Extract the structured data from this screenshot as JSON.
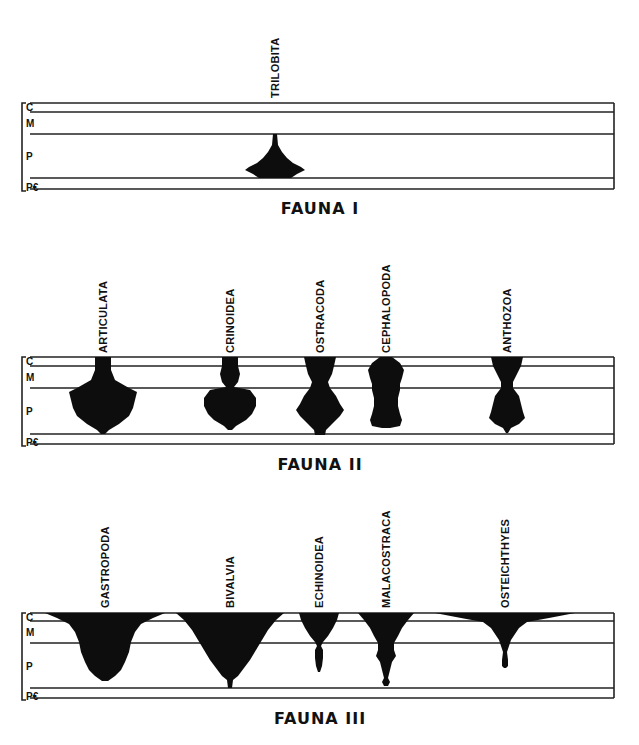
{
  "figure": {
    "era_labels": [
      "C",
      "M",
      "P",
      "P€"
    ],
    "panels": [
      {
        "title": "FAUNA I",
        "top": 103,
        "c_line": 112,
        "m_line": 134,
        "p_bottom": 178,
        "pe_bottom": 189,
        "title_y": 214,
        "taxa": [
          {
            "name": "TRILOBITA",
            "x": 275,
            "label_bottom": 98,
            "profile": [
              [
                134,
                2
              ],
              [
                145,
                3
              ],
              [
                152,
                7
              ],
              [
                158,
                12
              ],
              [
                163,
                18
              ],
              [
                167,
                26
              ],
              [
                170,
                30
              ],
              [
                174,
                22
              ],
              [
                178,
                16
              ]
            ]
          }
        ]
      },
      {
        "title": "FAUNA II",
        "top": 357,
        "c_line": 366,
        "m_line": 388,
        "p_bottom": 434,
        "pe_bottom": 444,
        "title_y": 470,
        "taxa": [
          {
            "name": "ARTICULATA",
            "x": 103,
            "label_bottom": 353,
            "profile": [
              [
                357,
                8
              ],
              [
                370,
                8
              ],
              [
                380,
                12
              ],
              [
                388,
                26
              ],
              [
                392,
                34
              ],
              [
                400,
                32
              ],
              [
                408,
                30
              ],
              [
                416,
                26
              ],
              [
                424,
                16
              ],
              [
                430,
                6
              ],
              [
                434,
                2
              ]
            ]
          },
          {
            "name": "CRINOIDEA",
            "x": 230,
            "label_bottom": 353,
            "profile": [
              [
                357,
                8
              ],
              [
                366,
                8
              ],
              [
                374,
                10
              ],
              [
                382,
                8
              ],
              [
                387,
                4
              ],
              [
                390,
                20
              ],
              [
                398,
                26
              ],
              [
                406,
                26
              ],
              [
                414,
                22
              ],
              [
                420,
                16
              ],
              [
                426,
                6
              ],
              [
                430,
                2
              ]
            ]
          },
          {
            "name": "OSTRACODA",
            "x": 320,
            "label_bottom": 353,
            "profile": [
              [
                357,
                16
              ],
              [
                366,
                14
              ],
              [
                374,
                12
              ],
              [
                382,
                8
              ],
              [
                388,
                10
              ],
              [
                396,
                16
              ],
              [
                404,
                20
              ],
              [
                410,
                24
              ],
              [
                416,
                20
              ],
              [
                424,
                12
              ],
              [
                430,
                6
              ],
              [
                435,
                5
              ]
            ]
          },
          {
            "name": "CEPHALOPODA",
            "x": 386,
            "label_bottom": 353,
            "profile": [
              [
                357,
                6
              ],
              [
                363,
                14
              ],
              [
                370,
                18
              ],
              [
                378,
                16
              ],
              [
                384,
                14
              ],
              [
                390,
                14
              ],
              [
                398,
                12
              ],
              [
                406,
                12
              ],
              [
                414,
                14
              ],
              [
                420,
                16
              ],
              [
                426,
                14
              ],
              [
                428,
                4
              ]
            ]
          },
          {
            "name": "ANTHOZOA",
            "x": 507,
            "label_bottom": 353,
            "profile": [
              [
                357,
                16
              ],
              [
                366,
                14
              ],
              [
                374,
                10
              ],
              [
                382,
                6
              ],
              [
                388,
                6
              ],
              [
                396,
                12
              ],
              [
                404,
                14
              ],
              [
                412,
                16
              ],
              [
                418,
                18
              ],
              [
                424,
                12
              ],
              [
                428,
                4
              ],
              [
                433,
                1
              ]
            ]
          }
        ]
      },
      {
        "title": "FAUNA III",
        "top": 613,
        "c_line": 621,
        "m_line": 643,
        "p_bottom": 688,
        "pe_bottom": 698,
        "title_y": 724,
        "taxa": [
          {
            "name": "GASTROPODA",
            "x": 105,
            "label_bottom": 608,
            "profile": [
              [
                613,
                60
              ],
              [
                618,
                48
              ],
              [
                624,
                36
              ],
              [
                632,
                30
              ],
              [
                642,
                26
              ],
              [
                652,
                24
              ],
              [
                662,
                20
              ],
              [
                670,
                16
              ],
              [
                676,
                10
              ],
              [
                681,
                3
              ]
            ]
          },
          {
            "name": "BIVALVIA",
            "x": 230,
            "label_bottom": 608,
            "profile": [
              [
                613,
                54
              ],
              [
                620,
                46
              ],
              [
                630,
                38
              ],
              [
                640,
                32
              ],
              [
                650,
                26
              ],
              [
                660,
                20
              ],
              [
                668,
                14
              ],
              [
                676,
                8
              ],
              [
                680,
                3
              ],
              [
                688,
                2
              ]
            ]
          },
          {
            "name": "ECHINOIDEA",
            "x": 319,
            "label_bottom": 608,
            "profile": [
              [
                613,
                20
              ],
              [
                620,
                18
              ],
              [
                628,
                14
              ],
              [
                636,
                9
              ],
              [
                642,
                4
              ],
              [
                646,
                2
              ],
              [
                650,
                4
              ],
              [
                658,
                4
              ],
              [
                666,
                3
              ],
              [
                672,
                1
              ]
            ]
          },
          {
            "name": "MALACOSTRACA",
            "x": 386,
            "label_bottom": 608,
            "profile": [
              [
                613,
                28
              ],
              [
                620,
                22
              ],
              [
                628,
                16
              ],
              [
                636,
                12
              ],
              [
                643,
                8
              ],
              [
                650,
                8
              ],
              [
                656,
                10
              ],
              [
                662,
                6
              ],
              [
                670,
                4
              ],
              [
                678,
                2
              ],
              [
                682,
                4
              ],
              [
                686,
                2
              ]
            ]
          },
          {
            "name": "OSTEICHTHYES",
            "x": 505,
            "label_bottom": 608,
            "profile": [
              [
                613,
                70
              ],
              [
                618,
                44
              ],
              [
                622,
                22
              ],
              [
                628,
                14
              ],
              [
                634,
                10
              ],
              [
                640,
                6
              ],
              [
                646,
                4
              ],
              [
                652,
                2
              ],
              [
                660,
                3
              ],
              [
                666,
                3
              ],
              [
                668,
                1
              ]
            ]
          }
        ]
      }
    ],
    "frame": {
      "left": 30,
      "right": 614,
      "bracket_x": 22
    }
  }
}
